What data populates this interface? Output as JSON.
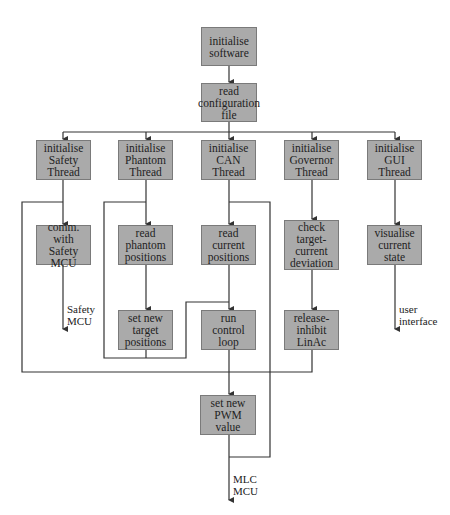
{
  "diagram": {
    "type": "flowchart",
    "nodes": {
      "init_software": "initialise software",
      "read_config": "read configuration file",
      "init_safety": "initialise Safety Thread",
      "init_phantom": "initialise Phantom Thread",
      "init_can": "initialise CAN Thread",
      "init_governor": "initialise Governor Thread",
      "init_gui": "initialise GUI Thread",
      "comm_safety": "comm. with Safety MCU",
      "read_phantom": "read phantom positions",
      "read_current": "read current positions",
      "check_deviation": "check target-current deviation",
      "visualise": "visualise current state",
      "set_target": "set new target positions",
      "run_control": "run control loop",
      "release_inhibit": "release-inhibit LinAc",
      "set_pwm": "set new PWM value"
    },
    "node_lines": {
      "init_software": [
        "initialise",
        "software"
      ],
      "read_config": [
        "read config-",
        "uration file"
      ],
      "init_safety": [
        "initialise",
        "Safety",
        "Thread"
      ],
      "init_phantom": [
        "initialise",
        "Phantom",
        "Thread"
      ],
      "init_can": [
        "initialise",
        "CAN",
        "Thread"
      ],
      "init_governor": [
        "initialise",
        "Governor",
        "Thread"
      ],
      "init_gui": [
        "initialise",
        "GUI Thread"
      ],
      "comm_safety": [
        "comm.",
        "with Safety",
        "MCU"
      ],
      "read_phantom": [
        "read",
        "phantom",
        "positions"
      ],
      "read_current": [
        "read current",
        "positions"
      ],
      "check_deviation": [
        "check",
        "target-",
        "current",
        "deviation"
      ],
      "visualise": [
        "visualise",
        "current state"
      ],
      "set_target": [
        "set new",
        "target",
        "positions"
      ],
      "run_control": [
        "run control",
        "loop"
      ],
      "release_inhibit": [
        "release-",
        "inhibit",
        "LinAc"
      ],
      "set_pwm": [
        "set new",
        "PWM value"
      ]
    },
    "outputs": {
      "safety_mcu": [
        "Safety",
        "MCU"
      ],
      "user_interface": [
        "user",
        "interface"
      ],
      "mlc_mcu": [
        "MLC",
        "MCU"
      ]
    },
    "colors": {
      "box_fill": "#aaaaaa",
      "box_border": "#7a7a7a",
      "line": "#333333"
    }
  }
}
